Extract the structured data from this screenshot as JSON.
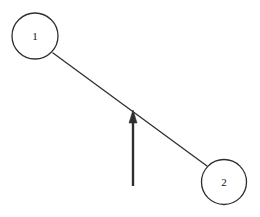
{
  "diagram": {
    "type": "node-link-graph",
    "background_color": "#ffffff",
    "stroke_color": "#2f2f2f",
    "label_color": "#111111",
    "canvas": {
      "width": 260,
      "height": 217
    },
    "nodes": [
      {
        "id": "node-1",
        "label": "1",
        "cx": 35,
        "cy": 36,
        "r": 23,
        "stroke_width": 1.3,
        "fill": "#ffffff",
        "font_size": 11
      },
      {
        "id": "node-2",
        "label": "2",
        "cx": 224,
        "cy": 182,
        "r": 22.5,
        "stroke_width": 1.3,
        "fill": "#ffffff",
        "font_size": 11
      }
    ],
    "edges": [
      {
        "id": "edge-1-2",
        "from": "node-1",
        "to": "node-2",
        "x1": 53,
        "y1": 53,
        "x2": 207,
        "y2": 166,
        "stroke_width": 1.3,
        "label": ""
      }
    ],
    "arrows": [
      {
        "id": "force-arrow",
        "label": "",
        "direction": "up",
        "tail_x": 133,
        "tail_y": 186,
        "tip_x": 133,
        "tip_y": 110,
        "shaft_width": 2.4,
        "head_width": 8,
        "head_length": 13,
        "stroke_width": 1
      }
    ]
  }
}
